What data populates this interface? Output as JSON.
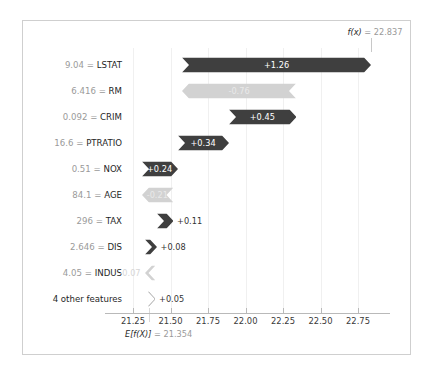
{
  "figure": {
    "type": "shap-waterfall",
    "background": "#ffffff",
    "frame_color": "#cfcfcf",
    "positive_color": "#3f3f3f",
    "negative_color": "#d2d2d2"
  },
  "annotations": {
    "fx_label": "f(x)",
    "fx_equals": " = ",
    "fx_value": "22.837",
    "base_label": "E[f(X)]",
    "base_equals": " = ",
    "base_value": "21.354"
  },
  "axis": {
    "ticks": [
      "21.25",
      "21.50",
      "21.75",
      "22.00",
      "22.25",
      "22.50",
      "22.75"
    ],
    "tick_values": [
      21.25,
      21.5,
      21.75,
      22.0,
      22.25,
      22.5,
      22.75
    ],
    "xlim": [
      21.15,
      22.92
    ]
  },
  "rows": [
    {
      "value": "9.04",
      "equals": "=",
      "feature": "LSTAT",
      "shap_label": "+1.26",
      "shap": 1.26,
      "sign": "pos",
      "label_inside": true
    },
    {
      "value": "6.416",
      "equals": "=",
      "feature": "RM",
      "shap_label": "-0.76",
      "shap": -0.76,
      "sign": "neg",
      "label_inside": true
    },
    {
      "value": "0.092",
      "equals": "=",
      "feature": "CRIM",
      "shap_label": "+0.45",
      "shap": 0.45,
      "sign": "pos",
      "label_inside": true
    },
    {
      "value": "16.6",
      "equals": "=",
      "feature": "PTRATIO",
      "shap_label": "+0.34",
      "shap": 0.34,
      "sign": "pos",
      "label_inside": true
    },
    {
      "value": "0.51",
      "equals": "=",
      "feature": "NOX",
      "shap_label": "+0.24",
      "shap": 0.24,
      "sign": "pos",
      "label_inside": true
    },
    {
      "value": "84.1",
      "equals": "=",
      "feature": "AGE",
      "shap_label": "-0.21",
      "shap": -0.21,
      "sign": "neg",
      "label_inside": true
    },
    {
      "value": "296",
      "equals": "=",
      "feature": "TAX",
      "shap_label": "+0.11",
      "shap": 0.11,
      "sign": "pos",
      "label_inside": false
    },
    {
      "value": "2.646",
      "equals": "=",
      "feature": "DIS",
      "shap_label": "+0.08",
      "shap": 0.08,
      "sign": "pos",
      "label_inside": false
    },
    {
      "value": "4.05",
      "equals": "=",
      "feature": "INDUS",
      "shap_label": "-0.07",
      "shap": -0.07,
      "sign": "neg",
      "label_inside": false
    },
    {
      "value": "",
      "equals": "",
      "feature": "4 other features",
      "plain": true,
      "shap_label": "+0.05",
      "shap": 0.05,
      "sign": "pos",
      "label_inside": false
    }
  ],
  "chart_data": {
    "type": "bar",
    "title": "",
    "xlabel": "",
    "ylabel": "",
    "categories": [
      "9.04 = LSTAT",
      "6.416 = RM",
      "0.092 = CRIM",
      "16.6 = PTRATIO",
      "0.51 = NOX",
      "84.1 = AGE",
      "296 = TAX",
      "2.646 = DIS",
      "4.05 = INDUS",
      "4 other features"
    ],
    "values": [
      1.26,
      -0.76,
      0.45,
      0.34,
      0.24,
      -0.21,
      0.11,
      0.08,
      -0.07,
      0.05
    ],
    "base_value": 21.354,
    "output_value": 22.837,
    "xlim": [
      21.15,
      22.92
    ],
    "xticks": [
      21.25,
      21.5,
      21.75,
      22.0,
      22.25,
      22.5,
      22.75
    ],
    "grid": true,
    "legend": "none"
  }
}
